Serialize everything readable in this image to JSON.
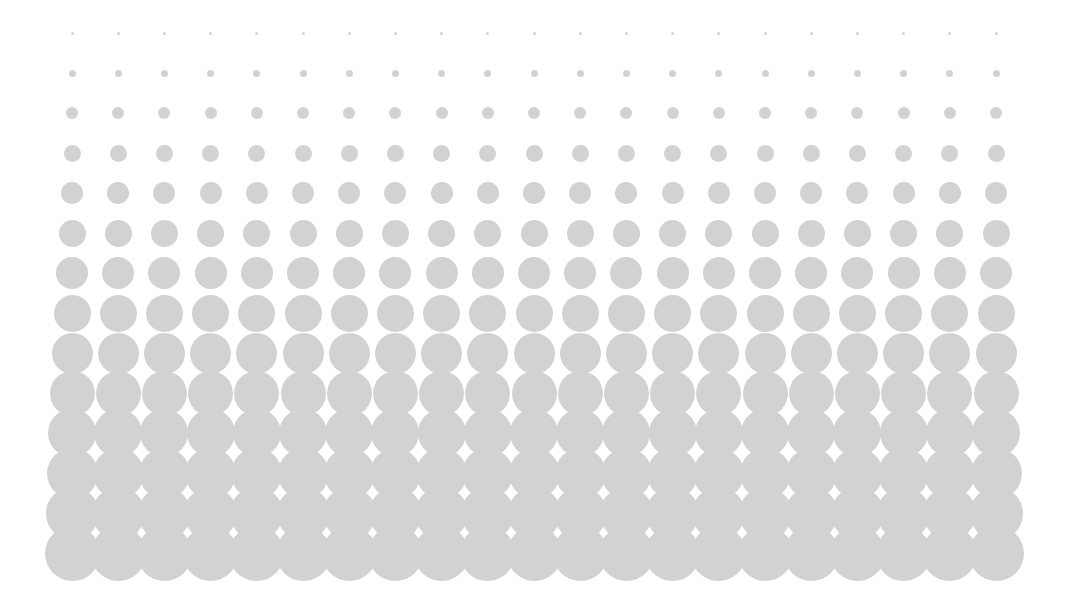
{
  "canvas": {
    "width": 1066,
    "height": 607,
    "background_color": "#ffffff",
    "title": "Halftone Dot Gradient"
  },
  "chart_data": {
    "type": "scatter",
    "xlabel": "",
    "ylabel": "",
    "grid": {
      "columns": 21,
      "rows": 14,
      "first_column_center_x": 72,
      "first_row_center_y": 33,
      "column_pitch": 46.2,
      "row_pitch": 40.0
    },
    "dot_color": "#d2d2d2",
    "dot_opacity": 1,
    "row_labels": [
      "row-1",
      "row-2",
      "row-3",
      "row-4",
      "row-5",
      "row-6",
      "row-7",
      "row-8",
      "row-9",
      "row-10",
      "row-11",
      "row-12",
      "row-13",
      "row-14"
    ],
    "row_diameters": [
      3,
      7,
      12,
      17,
      22,
      27,
      32,
      37,
      41,
      45,
      48,
      51,
      53,
      55
    ],
    "legend": [],
    "xlim": [
      0,
      1066
    ],
    "ylim": [
      0,
      607
    ],
    "grid_visible": false,
    "legend_position": "none"
  }
}
